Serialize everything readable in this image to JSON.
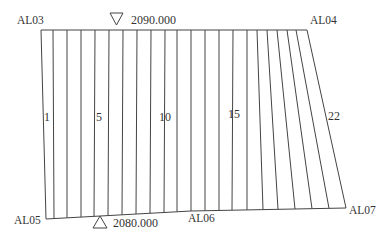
{
  "diagram": {
    "type": "section-strip-diagram",
    "colors": {
      "line": "#444444",
      "text": "#333333",
      "background": "#ffffff"
    },
    "corners": {
      "top_left": {
        "label": "AL03",
        "x": 41,
        "y": 30
      },
      "top_right": {
        "label": "AL04",
        "x": 307,
        "y": 30
      },
      "bottom_left": {
        "label": "AL05",
        "x": 46,
        "y": 219
      },
      "bottom_mid": {
        "label": "AL06",
        "x": 191,
        "y": 211
      },
      "bottom_right": {
        "label": "AL07",
        "x": 346,
        "y": 208
      }
    },
    "elevations": {
      "top": {
        "label": "2090.000",
        "marker": "triangle-down-icon"
      },
      "bottom": {
        "label": "2080.000",
        "marker": "triangle-up-icon"
      }
    },
    "strip_labels": [
      {
        "label": "1",
        "x": 44,
        "y": 121
      },
      {
        "label": "5",
        "x": 96,
        "y": 121
      },
      {
        "label": "10",
        "x": 159,
        "y": 121
      },
      {
        "label": "15",
        "x": 228,
        "y": 118
      },
      {
        "label": "22",
        "x": 328,
        "y": 120
      }
    ],
    "division_lines": [
      {
        "top": 53,
        "bottom": 54
      },
      {
        "top": 67,
        "bottom": 67
      },
      {
        "top": 81,
        "bottom": 81
      },
      {
        "top": 95,
        "bottom": 94
      },
      {
        "top": 109,
        "bottom": 108
      },
      {
        "top": 123,
        "bottom": 122
      },
      {
        "top": 137,
        "bottom": 136
      },
      {
        "top": 151,
        "bottom": 150
      },
      {
        "top": 165,
        "bottom": 164
      },
      {
        "top": 177,
        "bottom": 177
      },
      {
        "top": 191,
        "bottom": 191
      },
      {
        "top": 205,
        "bottom": 205
      },
      {
        "top": 219,
        "bottom": 219
      },
      {
        "top": 233,
        "bottom": 232
      },
      {
        "top": 247,
        "bottom": 247
      },
      {
        "top": 257,
        "bottom": 263
      },
      {
        "top": 267,
        "bottom": 278
      },
      {
        "top": 277,
        "bottom": 295
      },
      {
        "top": 287,
        "bottom": 312
      },
      {
        "top": 296,
        "bottom": 329
      }
    ]
  }
}
